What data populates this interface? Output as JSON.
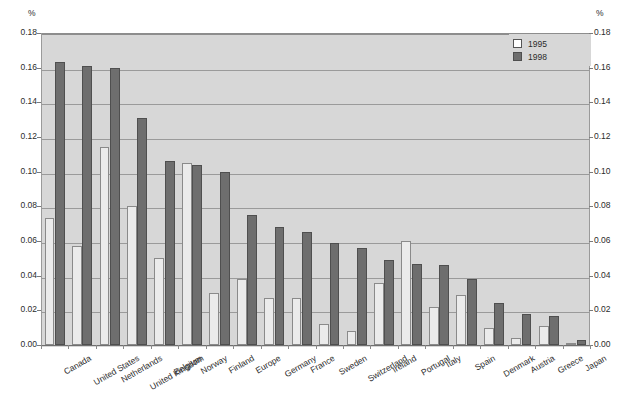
{
  "axis": {
    "unit_left": "%",
    "unit_right": "%",
    "ticks": [
      "0.18",
      "0.16",
      "0.14",
      "0.12",
      "0.10",
      "0.08",
      "0.06",
      "0.04",
      "0.02",
      "0.00"
    ]
  },
  "legend": {
    "items": [
      {
        "label": "1995",
        "swatch": "y1995",
        "color": "#ffffff"
      },
      {
        "label": "1998",
        "swatch": "y1998",
        "color": "#6e6e6e"
      }
    ]
  },
  "colors": {
    "plot_background": "#d7d7d7",
    "gridline": "#9a9a9a",
    "bar_1995": "#ebebeb",
    "bar_1998": "#6e6e6e",
    "text": "#2b2b2b"
  },
  "chart_data": {
    "type": "bar",
    "title": "",
    "subtitle": "",
    "xlabel": "",
    "ylabel": "%",
    "ylim": [
      0,
      0.18
    ],
    "ytick_step": 0.02,
    "grid": true,
    "legend_position": "top-right",
    "categories": [
      "Canada",
      "United States",
      "Netherlands",
      "United Kingdom",
      "Belgium",
      "Norway",
      "Finland",
      "Europe",
      "Germany",
      "France",
      "Sweden",
      "Switzerland",
      "Ireland",
      "Portugal",
      "Italy",
      "Spain",
      "Denmark",
      "Austria",
      "Greece",
      "Japan"
    ],
    "series": [
      {
        "name": "1995",
        "values": [
          0.073,
          0.057,
          0.114,
          0.08,
          0.05,
          0.105,
          0.03,
          0.038,
          0.027,
          0.027,
          0.012,
          0.008,
          0.036,
          0.06,
          0.022,
          0.029,
          0.01,
          0.004,
          0.011,
          0.001
        ]
      },
      {
        "name": "1998",
        "values": [
          0.163,
          0.161,
          0.16,
          0.131,
          0.106,
          0.104,
          0.1,
          0.075,
          0.068,
          0.065,
          0.059,
          0.056,
          0.049,
          0.047,
          0.046,
          0.038,
          0.024,
          0.018,
          0.017,
          0.003
        ]
      }
    ]
  }
}
